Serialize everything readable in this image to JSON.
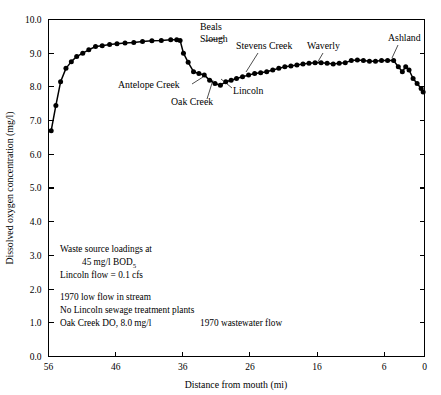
{
  "figure": {
    "title": "",
    "background_color": "#ffffff",
    "line_color": "#000000",
    "marker_color": "#000000"
  },
  "chart_data": {
    "type": "line",
    "title": "",
    "subtitle": "",
    "xlabel": "Distance from mouth (mi)",
    "ylabel": "Dissolved oxygen concentration (mg/l)",
    "xlim": [
      56,
      0
    ],
    "ylim": [
      0.0,
      10.0
    ],
    "x_reversed": true,
    "grid": false,
    "legend": "none",
    "xticks": [
      56,
      46,
      36,
      26,
      16,
      6,
      0
    ],
    "xticklabels": [
      "56",
      "46",
      "36",
      "26",
      "16",
      "6",
      "0"
    ],
    "yticks": [
      0.0,
      1.0,
      2.0,
      3.0,
      4.0,
      5.0,
      6.0,
      7.0,
      8.0,
      9.0,
      10.0
    ],
    "yticklabels": [
      "0.0",
      "1.0",
      "2.0",
      "3.0",
      "4.0",
      "5.0",
      "6.0",
      "7.0",
      "8.0",
      "9.0",
      "10.0"
    ],
    "series": [
      {
        "name": "Dissolved oxygen",
        "marker": "filled-circle",
        "x": [
          55.6,
          54.9,
          54.2,
          53.4,
          52.6,
          51.8,
          50.9,
          50.0,
          49.0,
          48.0,
          46.9,
          45.8,
          44.6,
          43.3,
          42.0,
          40.6,
          39.2,
          37.8,
          36.9,
          36.4,
          35.9,
          35.2,
          34.4,
          33.6,
          32.8,
          32.0,
          31.2,
          30.4,
          29.6,
          28.8,
          28.0,
          27.1,
          26.2,
          25.3,
          24.4,
          23.5,
          22.6,
          21.7,
          20.8,
          19.9,
          19.0,
          18.1,
          17.2,
          16.3,
          15.4,
          14.5,
          13.6,
          12.7,
          11.8,
          10.9,
          10.0,
          9.1,
          8.2,
          7.3,
          6.4,
          5.5,
          4.6,
          3.9,
          3.3,
          2.8,
          2.3,
          1.7,
          1.1,
          0.5,
          0.2
        ],
        "y": [
          6.7,
          7.45,
          8.15,
          8.55,
          8.75,
          8.9,
          9.0,
          9.1,
          9.2,
          9.22,
          9.26,
          9.28,
          9.3,
          9.32,
          9.35,
          9.37,
          9.38,
          9.4,
          9.4,
          9.38,
          9.0,
          8.73,
          8.45,
          8.4,
          8.35,
          8.2,
          8.1,
          8.05,
          8.15,
          8.2,
          8.25,
          8.3,
          8.35,
          8.4,
          8.42,
          8.45,
          8.5,
          8.55,
          8.6,
          8.62,
          8.65,
          8.68,
          8.7,
          8.72,
          8.72,
          8.7,
          8.68,
          8.7,
          8.72,
          8.78,
          8.8,
          8.78,
          8.76,
          8.76,
          8.78,
          8.78,
          8.78,
          8.6,
          8.45,
          8.6,
          8.5,
          8.25,
          8.1,
          7.95,
          7.85
        ]
      }
    ],
    "annotations": [
      {
        "label": "Beals\nSlough",
        "label_lines": [
          "Beals",
          "Slough"
        ],
        "text_x": 200,
        "text_y": 30,
        "anchor": "start",
        "leader": [
          [
            224,
            38
          ],
          [
            205,
            41
          ]
        ]
      },
      {
        "label": "Antelope Creek",
        "label_lines": [
          "Antelope Creek"
        ],
        "text_x": 118,
        "text_y": 88,
        "anchor": "start",
        "leader": [
          [
            192,
            84
          ],
          [
            203,
            77
          ]
        ]
      },
      {
        "label": "Oak Creek",
        "label_lines": [
          "Oak Creek"
        ],
        "text_x": 171,
        "text_y": 105,
        "anchor": "start",
        "leader": [
          [
            207,
            99
          ],
          [
            213,
            80
          ]
        ]
      },
      {
        "label": "Lincoln",
        "label_lines": [
          "Lincoln"
        ],
        "text_x": 233,
        "text_y": 94,
        "anchor": "start",
        "leader": [
          [
            232,
            88
          ],
          [
            221,
            79
          ]
        ]
      },
      {
        "label": "Stevens Creek",
        "label_lines": [
          "Stevens Creek"
        ],
        "text_x": 236,
        "text_y": 49,
        "anchor": "start",
        "leader": [
          [
            258,
            53
          ],
          [
            246,
            72
          ]
        ]
      },
      {
        "label": "Waverly",
        "label_lines": [
          "Waverly"
        ],
        "text_x": 307,
        "text_y": 49,
        "anchor": "start",
        "leader": [
          [
            323,
            53
          ],
          [
            316,
            65
          ]
        ]
      },
      {
        "label": "Ashland",
        "label_lines": [
          "Ashland"
        ],
        "text_x": 388,
        "text_y": 41,
        "anchor": "start",
        "leader": [
          [
            398,
            45
          ],
          [
            392,
            58
          ]
        ]
      }
    ]
  },
  "notes": {
    "block_a": [
      "Waste source loadings at",
      "45 mg/l BOD",
      "Lincoln flow = 0.1 cfs"
    ],
    "bod_subscript": "5",
    "block_b": [
      "1970 low flow in stream",
      "No Lincoln sewage treatment plants"
    ],
    "bottom_left": "Oak Creek DO, 8.0 mg/l",
    "bottom_right": "1970 wastewater flow"
  }
}
